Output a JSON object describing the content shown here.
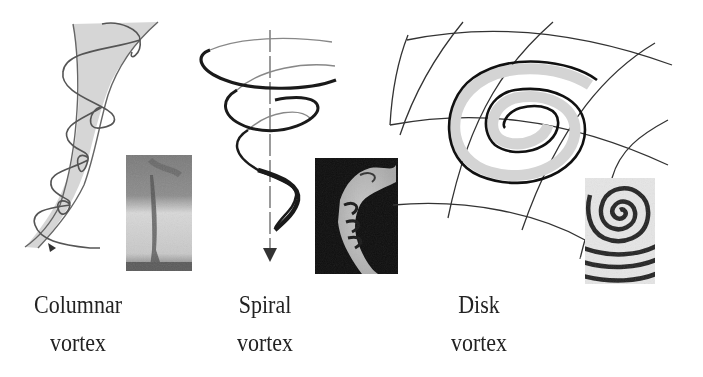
{
  "figure": {
    "panels": [
      {
        "id": "columnar",
        "label_line1": "Columnar",
        "label_line2": "vortex",
        "inset": "tornado-photo",
        "colors": {
          "line": "#555555",
          "fill": "#d6d6d6"
        }
      },
      {
        "id": "spiral",
        "label_line1": "Spiral",
        "label_line2": "vortex",
        "inset": "smoke-plume-photo",
        "colors": {
          "line": "#1a1a1a",
          "axis": "#666666"
        }
      },
      {
        "id": "disk",
        "label_line1": "Disk",
        "label_line2": "vortex",
        "inset": "spiral-wave-pattern",
        "colors": {
          "line": "#111111",
          "band": "#d4d4d4",
          "grid": "#333333"
        }
      }
    ]
  }
}
